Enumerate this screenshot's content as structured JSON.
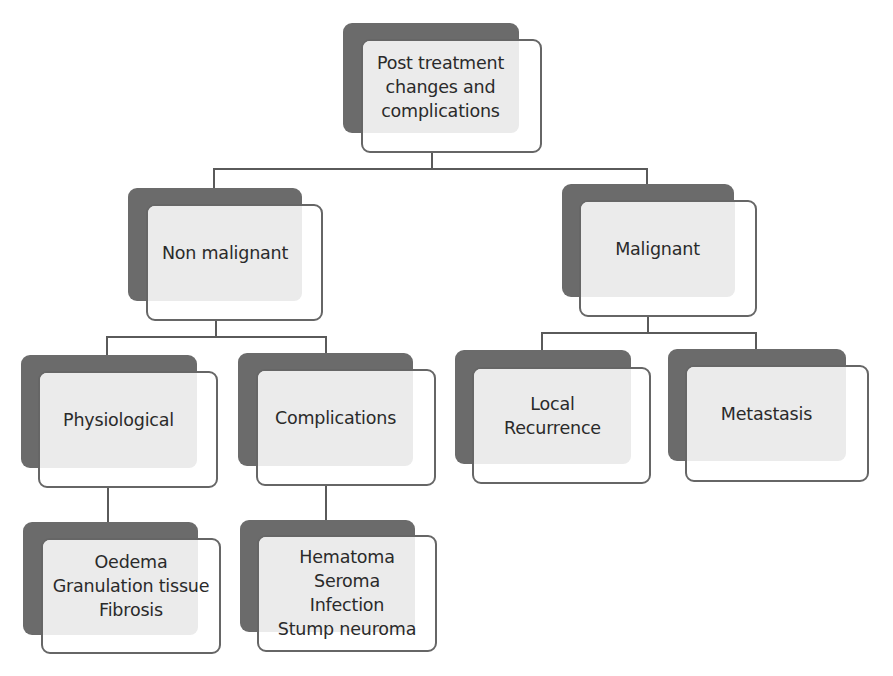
{
  "diagram": {
    "type": "hierarchy",
    "root": {
      "id": "root",
      "label": "Post treatment\nchanges and\ncomplications"
    },
    "nodes": [
      {
        "id": "root",
        "label": "Post treatment\nchanges and\ncomplications",
        "parent": null
      },
      {
        "id": "non-malignant",
        "label": "Non malignant",
        "parent": "root"
      },
      {
        "id": "malignant",
        "label": "Malignant",
        "parent": "root"
      },
      {
        "id": "physiological",
        "label": "Physiological",
        "parent": "non-malignant"
      },
      {
        "id": "complications",
        "label": "Complications",
        "parent": "non-malignant"
      },
      {
        "id": "local-recurrence",
        "label": "Local\nRecurrence",
        "parent": "malignant"
      },
      {
        "id": "metastasis",
        "label": "Metastasis",
        "parent": "malignant"
      },
      {
        "id": "physiological-examples",
        "label": "Oedema\nGranulation tissue\nFibrosis",
        "parent": "physiological"
      },
      {
        "id": "complications-examples",
        "label": "Hematoma\nSeroma\nInfection\nStump neuroma",
        "parent": "complications"
      }
    ],
    "colors": {
      "back_panel": "#6b6b6b",
      "front_fill": "#ebebeb",
      "front_bg": "#ffffff",
      "border": "#666666",
      "connector": "#5a5a5a",
      "text": "#2a2a2a"
    }
  }
}
